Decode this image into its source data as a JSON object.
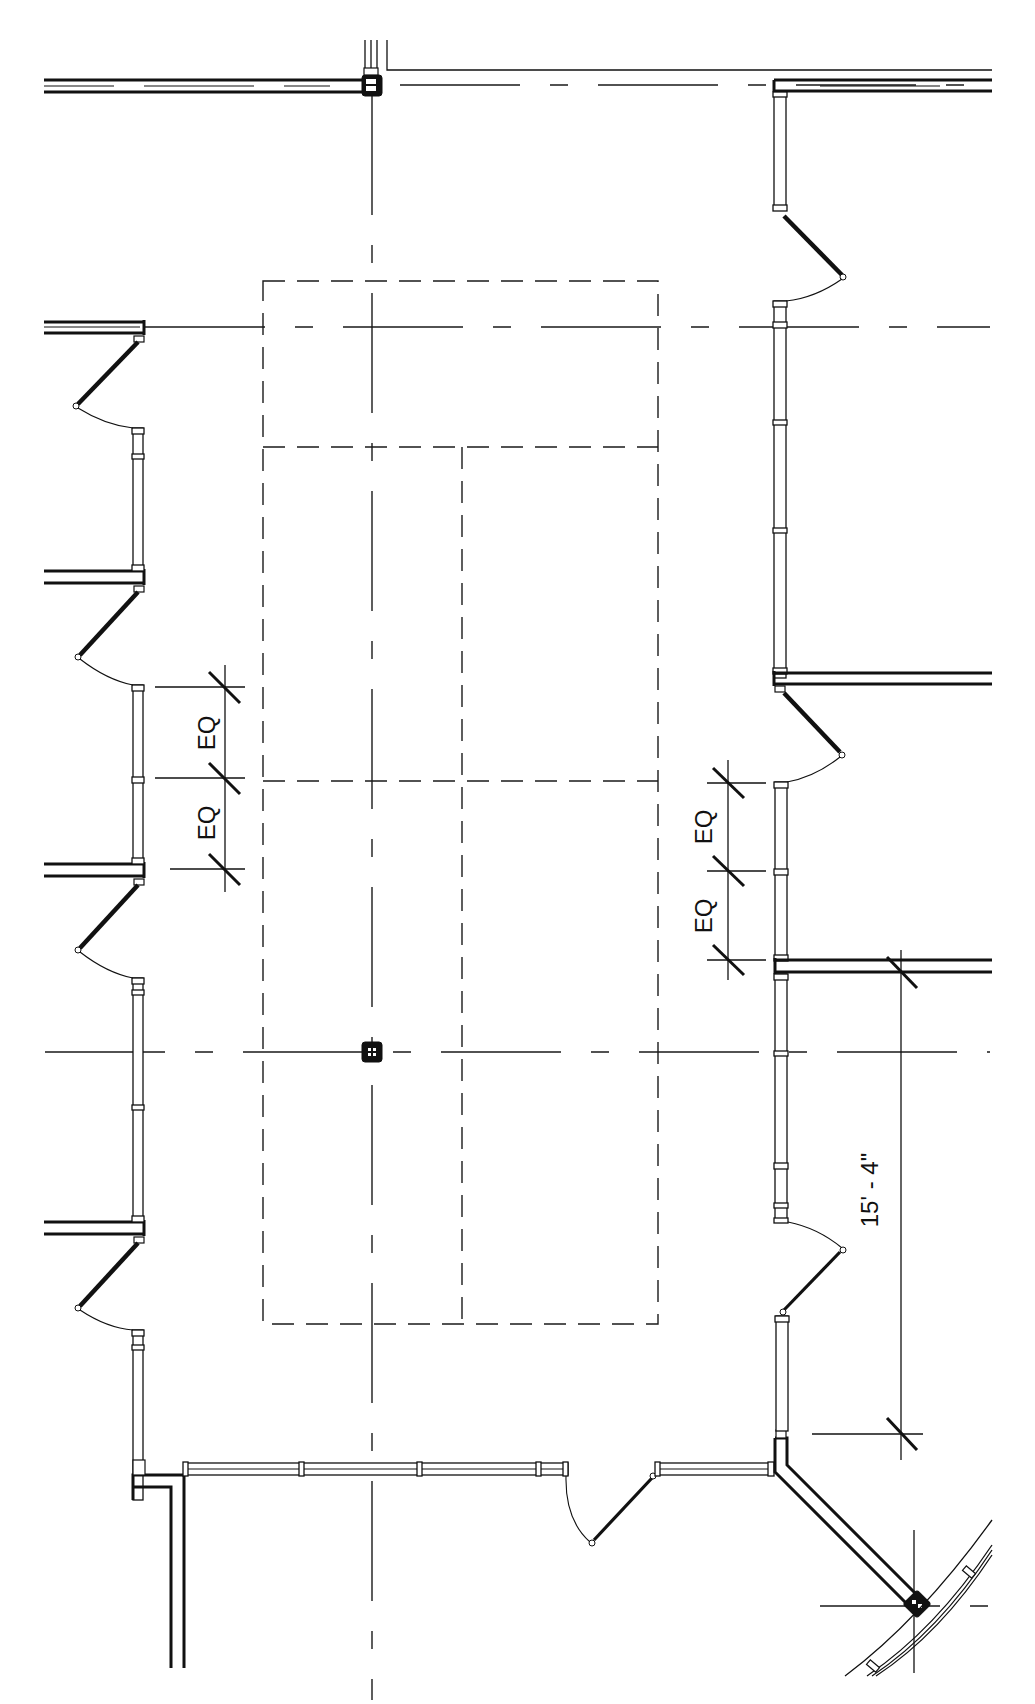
{
  "drawing": {
    "type": "architectural-floor-plan",
    "description": "Reflected ceiling / floor plan of a rectangular room with glazed partitions, swing doors, structural columns and gridlines",
    "colors": {
      "line": "#111111",
      "background": "#ffffff"
    }
  },
  "dimensions": {
    "left_eq_top": "EQ",
    "left_eq_bottom": "EQ",
    "right_eq_top": "EQ",
    "right_eq_bottom": "EQ",
    "overall": "15' - 4\""
  },
  "elements": {
    "columns": [
      "column-top",
      "column-center",
      "column-bottom-right"
    ],
    "doors_left": 4,
    "doors_right": 3,
    "doors_bottom": 1,
    "ceiling_grid": "dashed rectangular panels"
  }
}
